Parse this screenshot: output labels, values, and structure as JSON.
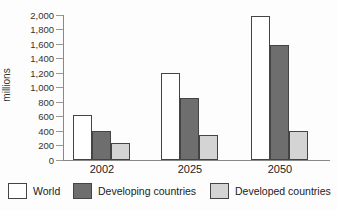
{
  "chart_data": {
    "type": "bar",
    "title": "",
    "ylabel": "millions",
    "categories": [
      "2002",
      "2025",
      "2050"
    ],
    "series": [
      {
        "name": "World",
        "fill": "#ffffff",
        "values": [
          620,
          1200,
          1980
        ]
      },
      {
        "name": "Developing countries",
        "fill": "#6e6e6e",
        "values": [
          400,
          850,
          1580
        ]
      },
      {
        "name": "Developed countries",
        "fill": "#d4d4d4",
        "values": [
          230,
          350,
          400
        ]
      }
    ],
    "ylim": [
      0,
      2000
    ],
    "ytick_step": 200,
    "ytick_labels": [
      "0",
      "200",
      "400",
      "600",
      "800",
      "1,000",
      "1,200",
      "1,400",
      "1,600",
      "1,800",
      "2,000"
    ],
    "grid": false,
    "legend_position": "bottom",
    "colors": {
      "bar_border": "#444444",
      "axis": "#888888",
      "text": "#333333"
    }
  }
}
